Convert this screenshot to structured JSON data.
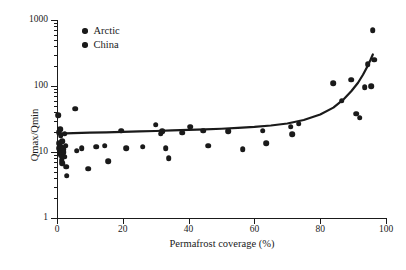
{
  "chart_data": {
    "type": "scatter",
    "title": "",
    "xlabel": "Permafrost coverage (%)",
    "ylabel": "Qmax/Qmin",
    "xlim": [
      0,
      100
    ],
    "ylim": [
      1,
      1000
    ],
    "yscale": "log",
    "xscale": "linear",
    "grid": false,
    "legend_position": "top-left",
    "xticks": [
      0,
      20,
      40,
      60,
      80,
      100
    ],
    "yticks": [
      1,
      10,
      100,
      1000
    ],
    "ytick_labels": [
      "1",
      "10",
      "100",
      "1000"
    ],
    "legend": [
      {
        "name": "Arctic",
        "marker": "circle",
        "color": "#1a1a1a"
      },
      {
        "name": "China",
        "marker": "circle",
        "color": "#1a1a1a"
      }
    ],
    "series": [
      {
        "name": "Arctic",
        "marker": "circle",
        "color": "#1a1a1a",
        "points": [
          [
            0.4,
            36.0
          ],
          [
            0.5,
            20.0
          ],
          [
            0.6,
            13.5
          ],
          [
            0.7,
            11.5
          ],
          [
            0.8,
            10.5
          ],
          [
            0.9,
            9.5
          ],
          [
            1.0,
            22.0
          ],
          [
            1.1,
            18.0
          ],
          [
            1.2,
            12.0
          ],
          [
            1.3,
            9.0
          ],
          [
            1.4,
            7.5
          ],
          [
            1.5,
            6.8
          ],
          [
            1.6,
            14.5
          ],
          [
            1.8,
            11.0
          ],
          [
            2.0,
            10.0
          ],
          [
            2.2,
            8.5
          ],
          [
            2.4,
            19.0
          ],
          [
            2.6,
            12.5
          ],
          [
            2.8,
            6.0
          ],
          [
            3.0,
            4.4
          ],
          [
            5.5,
            45.0
          ],
          [
            6.0,
            10.5
          ],
          [
            7.5,
            11.5
          ],
          [
            9.5,
            5.6
          ],
          [
            12.0,
            12.0
          ],
          [
            14.5,
            12.5
          ],
          [
            15.5,
            7.2
          ],
          [
            19.5,
            21.0
          ],
          [
            21.0,
            11.5
          ],
          [
            26.0,
            12.0
          ],
          [
            30.0,
            26.0
          ],
          [
            31.5,
            19.0
          ],
          [
            32.0,
            20.5
          ],
          [
            33.0,
            11.5
          ],
          [
            34.0,
            8.0
          ],
          [
            38.0,
            19.5
          ],
          [
            40.5,
            24.0
          ],
          [
            44.5,
            21.0
          ],
          [
            46.0,
            12.5
          ],
          [
            52.0,
            20.5
          ],
          [
            56.5,
            11.0
          ],
          [
            62.5,
            21.0
          ],
          [
            63.5,
            13.5
          ],
          [
            71.0,
            24.0
          ],
          [
            71.5,
            18.5
          ],
          [
            73.5,
            27.0
          ]
        ]
      },
      {
        "name": "China",
        "marker": "circle",
        "color": "#1a1a1a",
        "points": [
          [
            84.0,
            110.0
          ],
          [
            86.5,
            60.0
          ],
          [
            89.5,
            125.0
          ],
          [
            91.0,
            38.0
          ],
          [
            92.0,
            33.0
          ],
          [
            93.5,
            95.0
          ],
          [
            94.5,
            215.0
          ],
          [
            95.5,
            100.0
          ],
          [
            96.0,
            700.0
          ],
          [
            96.5,
            250.0
          ]
        ]
      }
    ],
    "trend_curve": {
      "style": "solid",
      "color": "#1a1a1a",
      "width": 2.2,
      "points": [
        [
          0.5,
          19.0
        ],
        [
          5.0,
          19.3
        ],
        [
          10.0,
          19.6
        ],
        [
          15.0,
          19.9
        ],
        [
          20.0,
          20.2
        ],
        [
          25.0,
          20.5
        ],
        [
          30.0,
          20.8
        ],
        [
          35.0,
          21.2
        ],
        [
          40.0,
          21.6
        ],
        [
          45.0,
          22.0
        ],
        [
          50.0,
          22.5
        ],
        [
          55.0,
          23.2
        ],
        [
          60.0,
          24.0
        ],
        [
          65.0,
          25.2
        ],
        [
          70.0,
          27.0
        ],
        [
          75.0,
          30.5
        ],
        [
          80.0,
          37.0
        ],
        [
          84.0,
          47.0
        ],
        [
          87.0,
          62.0
        ],
        [
          89.5,
          84.0
        ],
        [
          91.5,
          112.0
        ],
        [
          93.0,
          148.0
        ],
        [
          94.3,
          196.0
        ],
        [
          95.3,
          250.0
        ],
        [
          96.0,
          300.0
        ]
      ]
    }
  }
}
